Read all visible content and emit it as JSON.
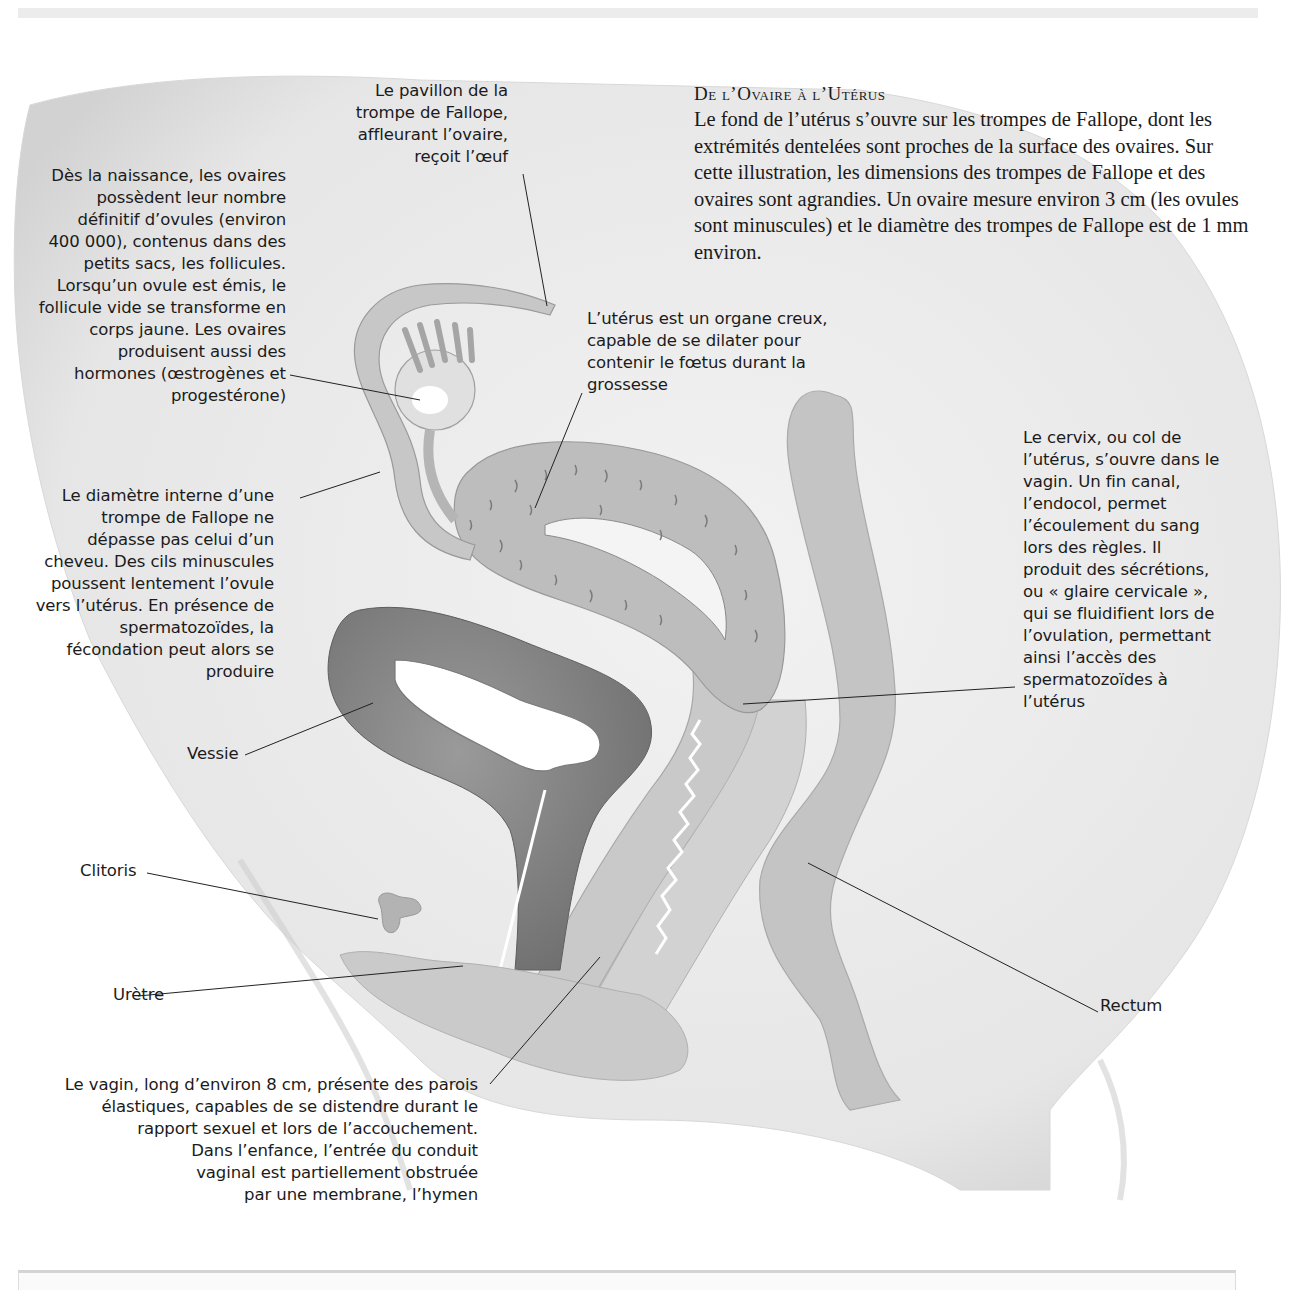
{
  "intro": {
    "title": "De l’Ovaire à l’Utérus",
    "body": "Le fond de l’utérus s’ouvre sur les trompes de Fallope, dont les extrémités dentelées sont proches de la surface des ovaires. Sur cette illustration, les dimensions des trompes de Fallope et des ovaires sont agrandies. Un ovaire mesure environ 3 cm (les ovules sont minuscules) et le diamètre des trompes de Fallope est de 1 mm environ."
  },
  "labels": {
    "pavillon": [
      "Le pavillon de la",
      "trompe de Fallope,",
      "affleurant l’ovaire,",
      "reçoit l’œuf"
    ],
    "ovaires": [
      "Dès la naissance, les ovaires",
      "possèdent leur nombre",
      "définitif d’ovules (environ",
      "400 000), contenus dans des",
      "petits sacs, les follicules.",
      "Lorsqu’un ovule est émis, le",
      "follicule vide se transforme en",
      "corps jaune. Les ovaires",
      "produisent aussi des",
      "hormones (œstrogènes et",
      "progestérone)"
    ],
    "uterus": [
      "L’utérus est un organe creux,",
      "capable de se dilater pour",
      "contenir le fœtus durant la",
      "grossesse"
    ],
    "trompe": [
      "Le diamètre interne d’une",
      "trompe de Fallope ne",
      "dépasse pas celui d’un",
      "cheveu. Des cils minuscules",
      "poussent lentement l’ovule",
      "vers l’utérus. En présence de",
      "spermatozoïdes, la",
      "fécondation peut alors se",
      "produire"
    ],
    "cervix": [
      "Le cervix, ou col de",
      "l’utérus, s’ouvre dans le",
      "vagin. Un fin canal,",
      "l’endocol, permet",
      "l’écoulement du sang",
      "lors des règles. Il",
      "produit des sécrétions,",
      "ou « glaire cervicale »,",
      "qui se fluidifient lors de",
      "l’ovulation, permettant",
      "ainsi l’accès des",
      "spermatozoïdes à",
      "l’utérus"
    ],
    "vessie": "Vessie",
    "clitoris": "Clitoris",
    "uretre": "Urètre",
    "rectum": "Rectum",
    "vagin": [
      "Le vagin, long d’environ 8 cm, présente des parois",
      "élastiques, capables de se distendre durant le",
      "rapport sexuel et lors de l’accouchement.",
      "Dans l’enfance, l’entrée du conduit",
      "vaginal est partiellement obstruée",
      "par une membrane, l’hymen"
    ]
  },
  "colors": {
    "body_fill": "#ededed",
    "organ_light": "#c9c9c9",
    "organ_mid": "#b3b3b3",
    "organ_dark": "#858585",
    "leader_line": "#222222"
  }
}
